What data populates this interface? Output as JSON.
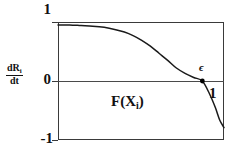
{
  "chart_data": {
    "type": "line",
    "title": "",
    "subtitle": "",
    "xlabel": "",
    "ylabel": "dR_i/dt",
    "ylabel_numerator": "dR",
    "ylabel_numerator_sub": "i",
    "ylabel_denominator": "dt",
    "xlim": [
      0,
      1.15
    ],
    "ylim": [
      -1,
      1
    ],
    "grid": false,
    "legend": null,
    "y_tick_labels": [
      "1",
      "0",
      "-1"
    ],
    "y_tick_values": [
      1,
      0,
      -1
    ],
    "x_tick_labels": [
      "1"
    ],
    "x_tick_values": [
      1
    ],
    "curve_label": "F(X",
    "curve_label_sub": "i",
    "curve_label_tail": ")",
    "annotations": [
      {
        "name": "epsilon-crossing",
        "text": "ϵ",
        "x": 1.0,
        "y": 0.0,
        "marker": "dot",
        "description": "zero crossing of F(X_i)"
      }
    ],
    "series": [
      {
        "name": "F(X_i)",
        "color": "#1a1a1a",
        "x": [
          0.0,
          0.08,
          0.16,
          0.24,
          0.32,
          0.4,
          0.46,
          0.52,
          0.58,
          0.64,
          0.7,
          0.76,
          0.82,
          0.88,
          0.94,
          1.0,
          1.05,
          1.09,
          1.12,
          1.15
        ],
        "y": [
          0.95,
          0.95,
          0.94,
          0.93,
          0.91,
          0.87,
          0.83,
          0.77,
          0.69,
          0.59,
          0.47,
          0.35,
          0.22,
          0.13,
          0.06,
          0.0,
          -0.22,
          -0.45,
          -0.66,
          -0.79
        ]
      }
    ],
    "colors": {
      "curve": "#1a1a1a",
      "frame": "#3a3a3a",
      "zero_line": "#4a4a4a",
      "text": "#111111",
      "background": "#ffffff",
      "marker": "#000000"
    }
  }
}
